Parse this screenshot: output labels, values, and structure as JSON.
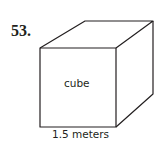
{
  "problem": {
    "number": "53."
  },
  "figure": {
    "shape": "cube",
    "face_label": "cube",
    "edge_label": "1.5 meters",
    "stroke_color": "#231f20"
  }
}
